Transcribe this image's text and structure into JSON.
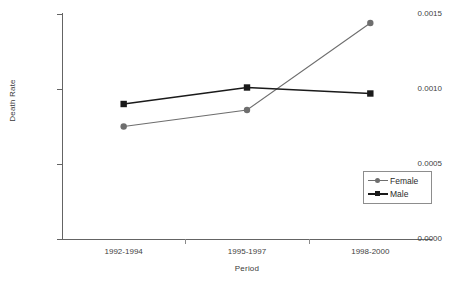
{
  "chart_data": {
    "type": "line",
    "title": "",
    "xlabel": "Period",
    "ylabel": "Death Rate",
    "categories": [
      "1992-1994",
      "1995-1997",
      "1998-2000"
    ],
    "series": [
      {
        "name": "Female",
        "marker": "circle",
        "color": "#6e6e6e",
        "values": [
          0.00075,
          0.00086,
          0.00144
        ]
      },
      {
        "name": "Male",
        "marker": "square",
        "color": "#1a1a1a",
        "values": [
          0.0009,
          0.00101,
          0.00097
        ]
      }
    ],
    "ylim": [
      0.0,
      0.0015
    ],
    "yticks": [
      "0.0000",
      "0.0005",
      "0.0010",
      "0.0015"
    ],
    "ytick_values": [
      0.0,
      0.0005,
      0.001,
      0.0015
    ],
    "grid": false,
    "legend_position": "center-right"
  },
  "legend": {
    "entries": [
      {
        "label": "Female"
      },
      {
        "label": "Male"
      }
    ]
  }
}
